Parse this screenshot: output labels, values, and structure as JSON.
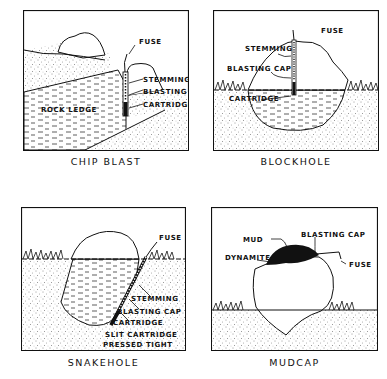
{
  "panels": [
    {
      "id": "chip-blast",
      "caption": "CHIP BLAST",
      "labels": {
        "fuse": "FUSE",
        "stemming": "STEMMING",
        "blasting_cap": "BLASTING CAP",
        "cartridge": "CARTRIDGE",
        "rock_ledge": "ROCK LEDGE"
      }
    },
    {
      "id": "blockhole",
      "caption": "BLOCKHOLE",
      "labels": {
        "fuse": "FUSE",
        "stemming": "STEMMING",
        "blasting_cap": "BLASTING CAP",
        "cartridge": "CARTRIDGE"
      }
    },
    {
      "id": "snakehole",
      "caption": "SNAKEHOLE",
      "labels": {
        "fuse": "FUSE",
        "stemming": "STEMMING",
        "blasting_cap": "BLASTING CAP",
        "cartridge": "CARTRIDGE",
        "slit_cartridge_1": "SLIT CARTRIDGE",
        "slit_cartridge_2": "PRESSED TIGHT"
      }
    },
    {
      "id": "mudcap",
      "caption": "MUDCAP",
      "labels": {
        "mud": "MUD",
        "blasting_cap": "BLASTING CAP",
        "dynamite": "DYNAMITE",
        "fuse": "FUSE"
      }
    }
  ],
  "colors": {
    "ink": "#111111",
    "paper": "#ffffff",
    "soil": "#e8e8e8"
  }
}
